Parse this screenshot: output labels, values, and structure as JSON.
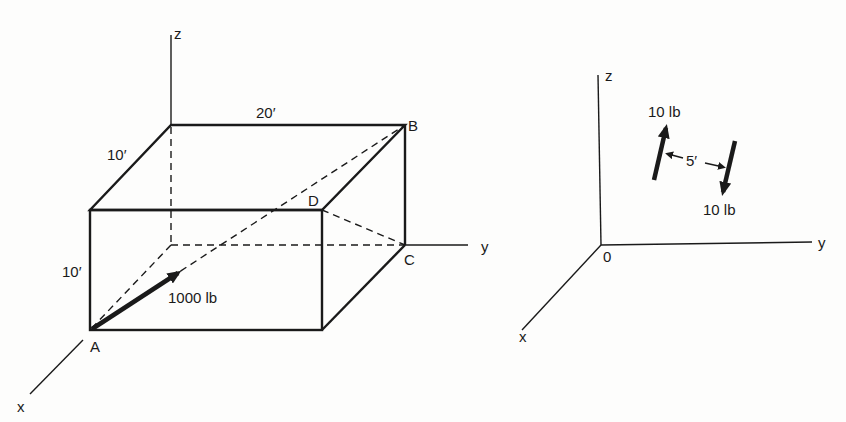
{
  "left_figure": {
    "axes": {
      "x": "x",
      "y": "y",
      "z": "z"
    },
    "points": {
      "A": "A",
      "B": "B",
      "C": "C",
      "D": "D"
    },
    "dimensions": {
      "length": "20′",
      "depth": "10′",
      "height": "10′"
    },
    "force": {
      "label": "1000 lb",
      "from": "A",
      "toward": "B"
    }
  },
  "right_figure": {
    "axes": {
      "x": "x",
      "y": "y",
      "z": "z"
    },
    "origin": "0",
    "forces": [
      {
        "label": "10 lb",
        "direction": "up"
      },
      {
        "label": "10 lb",
        "direction": "down"
      }
    ],
    "separation": "5′"
  }
}
